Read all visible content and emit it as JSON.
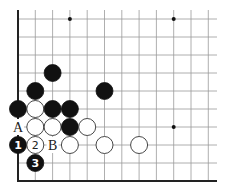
{
  "diagram": {
    "type": "go-board-corner",
    "corner": "bottom-left",
    "columns": 12,
    "rows": 10,
    "colors": {
      "black": "#111111",
      "white": "#ffffff",
      "grid": "#9a9a9a",
      "edge": "#222222"
    },
    "star_points": [
      {
        "col": 3,
        "row": 0
      },
      {
        "col": 9,
        "row": 0
      },
      {
        "col": 9,
        "row": 6
      }
    ],
    "stones": [
      {
        "color": "black",
        "col": 2,
        "row": 3,
        "label": ""
      },
      {
        "color": "black",
        "col": 1,
        "row": 4,
        "label": ""
      },
      {
        "color": "black",
        "col": 5,
        "row": 4,
        "label": ""
      },
      {
        "color": "black",
        "col": 0,
        "row": 5,
        "label": ""
      },
      {
        "color": "white",
        "col": 1,
        "row": 5,
        "label": ""
      },
      {
        "color": "black",
        "col": 2,
        "row": 5,
        "label": ""
      },
      {
        "color": "black",
        "col": 3,
        "row": 5,
        "label": ""
      },
      {
        "color": "white",
        "col": 1,
        "row": 6,
        "label": ""
      },
      {
        "color": "white",
        "col": 2,
        "row": 6,
        "label": ""
      },
      {
        "color": "black",
        "col": 3,
        "row": 6,
        "label": ""
      },
      {
        "color": "white",
        "col": 4,
        "row": 6,
        "label": ""
      },
      {
        "color": "black",
        "col": 0,
        "row": 7,
        "label": "1"
      },
      {
        "color": "white",
        "col": 1,
        "row": 7,
        "label": "2"
      },
      {
        "color": "white",
        "col": 3,
        "row": 7,
        "label": ""
      },
      {
        "color": "white",
        "col": 5,
        "row": 7,
        "label": ""
      },
      {
        "color": "white",
        "col": 7,
        "row": 7,
        "label": ""
      },
      {
        "color": "black",
        "col": 1,
        "row": 8,
        "label": "3"
      }
    ],
    "markers": [
      {
        "text": "A",
        "col": 0,
        "row": 6
      },
      {
        "text": "B",
        "col": 2,
        "row": 7
      }
    ]
  }
}
